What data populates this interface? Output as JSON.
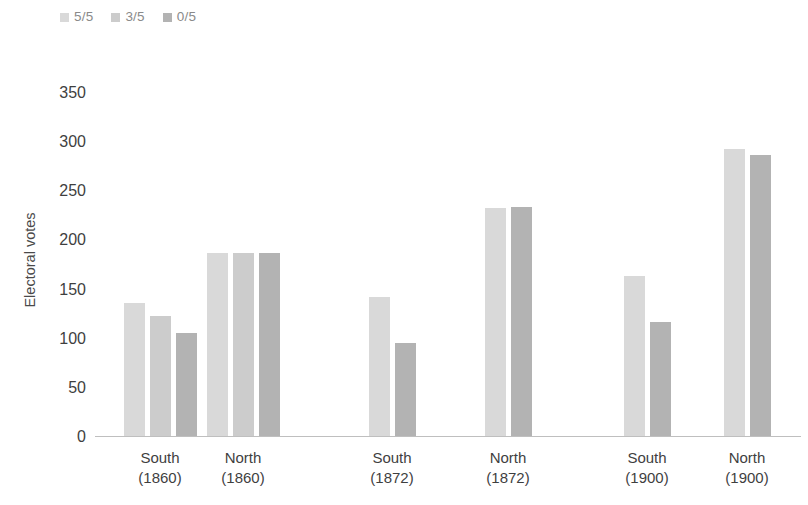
{
  "chart_data": {
    "type": "bar",
    "title": "",
    "subtitle": "",
    "xlabel": "",
    "ylabel": "Electoral votes",
    "ylim": [
      0,
      350
    ],
    "yticks": [
      0,
      50,
      100,
      150,
      200,
      250,
      300,
      350
    ],
    "ytick_labels": [
      "0",
      "50",
      "100",
      "150",
      "200",
      "250",
      "300",
      "350"
    ],
    "grid": false,
    "legend_position": "top-left",
    "categories": [
      "South (1860)",
      "North (1860)",
      "South (1872)",
      "North (1872)",
      "South (1900)",
      "North (1900)"
    ],
    "category_lines": [
      [
        "South",
        "(1860)"
      ],
      [
        "North",
        "(1860)"
      ],
      [
        "South",
        "(1872)"
      ],
      [
        "North",
        "(1872)"
      ],
      [
        "South",
        "(1900)"
      ],
      [
        "North",
        "(1900)"
      ]
    ],
    "series": [
      {
        "name": "5/5",
        "color": "#d9d9d9",
        "values": [
          135,
          186,
          141,
          231,
          162,
          292
        ]
      },
      {
        "name": "3/5",
        "color": "#cccccc",
        "values": [
          122,
          186,
          null,
          null,
          null,
          null
        ]
      },
      {
        "name": "0/5",
        "color": "#b3b3b3",
        "values": [
          104,
          186,
          94,
          232,
          116,
          285
        ]
      }
    ]
  },
  "legend": {
    "items": [
      {
        "label": "5/5",
        "color": "#d9d9d9"
      },
      {
        "label": "3/5",
        "color": "#cccccc"
      },
      {
        "label": "0/5",
        "color": "#b3b3b3"
      }
    ]
  },
  "axis": {
    "y_title": "Electoral votes"
  }
}
